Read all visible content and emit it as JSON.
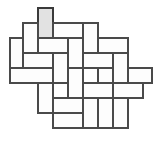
{
  "figure": {
    "width": 162,
    "height": 141,
    "background_color": "#ffffff",
    "unit": 15,
    "tile_long_side": 30,
    "tile_short_side": 15,
    "origin_x": 10,
    "origin_y": 8,
    "colors": {
      "tile_fill": "#fdfdfd",
      "tile_stroke": "#4a4a4a",
      "shaded_fill": "#e2e2e2",
      "shaded_stroke": "#3a3a3a"
    },
    "stroke_width": 1.4,
    "shaded_tile_index": 0,
    "tile_count": 20,
    "tiles": [
      {
        "name": "shaded-vertical-top",
        "x": 38,
        "y": 8,
        "w": 15,
        "h": 30,
        "orient": "vertical",
        "shaded": true
      },
      {
        "name": "tile-01",
        "x": 23,
        "y": 23,
        "w": 15,
        "h": 30,
        "orient": "vertical",
        "shaded": false
      },
      {
        "name": "tile-02",
        "x": 53,
        "y": 23,
        "w": 30,
        "h": 15,
        "orient": "horizontal",
        "shaded": false
      },
      {
        "name": "tile-03",
        "x": 83,
        "y": 23,
        "w": 15,
        "h": 30,
        "orient": "vertical",
        "shaded": false
      },
      {
        "name": "tile-04",
        "x": 98,
        "y": 38,
        "w": 30,
        "h": 15,
        "orient": "horizontal",
        "shaded": false
      },
      {
        "name": "tile-05",
        "x": 10,
        "y": 38,
        "w": 13,
        "h": 30,
        "orient": "vertical",
        "shaded": false
      },
      {
        "name": "tile-06",
        "x": 38,
        "y": 38,
        "w": 30,
        "h": 15,
        "orient": "horizontal",
        "shaded": false
      },
      {
        "name": "tile-07",
        "x": 68,
        "y": 38,
        "w": 15,
        "h": 30,
        "orient": "vertical",
        "shaded": false
      },
      {
        "name": "tile-08",
        "x": 113,
        "y": 53,
        "w": 15,
        "h": 30,
        "orient": "vertical",
        "shaded": false
      },
      {
        "name": "tile-09",
        "x": 83,
        "y": 53,
        "w": 30,
        "h": 15,
        "orient": "horizontal",
        "shaded": false
      },
      {
        "name": "tile-10",
        "x": 53,
        "y": 53,
        "w": 15,
        "h": 30,
        "orient": "vertical",
        "shaded": false
      },
      {
        "name": "tile-11",
        "x": 10,
        "y": 68,
        "w": 43,
        "h": 15,
        "orient": "horizontal",
        "shaded": false
      },
      {
        "name": "tile-12",
        "x": 128,
        "y": 68,
        "w": 24,
        "h": 15,
        "orient": "horizontal",
        "shaded": false
      },
      {
        "name": "tile-13",
        "x": 68,
        "y": 68,
        "w": 15,
        "h": 30,
        "orient": "vertical",
        "shaded": false
      },
      {
        "name": "tile-14",
        "x": 98,
        "y": 68,
        "w": 15,
        "h": 30,
        "orient": "vertical",
        "shaded": false
      },
      {
        "name": "tile-15",
        "x": 83,
        "y": 83,
        "w": 30,
        "h": 15,
        "orient": "horizontal",
        "shaded": false
      },
      {
        "name": "tile-16",
        "x": 113,
        "y": 83,
        "w": 30,
        "h": 15,
        "orient": "horizontal",
        "shaded": false
      },
      {
        "name": "tile-17",
        "x": 38,
        "y": 83,
        "w": 15,
        "h": 30,
        "orient": "vertical",
        "shaded": false
      },
      {
        "name": "tile-18",
        "x": 53,
        "y": 98,
        "w": 30,
        "h": 15,
        "orient": "horizontal",
        "shaded": false
      },
      {
        "name": "tile-19",
        "x": 83,
        "y": 98,
        "w": 15,
        "h": 30,
        "orient": "vertical",
        "shaded": false
      },
      {
        "name": "tile-20",
        "x": 113,
        "y": 98,
        "w": 15,
        "h": 30,
        "orient": "vertical",
        "shaded": false
      },
      {
        "name": "tile-21",
        "x": 98,
        "y": 98,
        "w": 15,
        "h": 30,
        "orient": "vertical",
        "shaded": false
      },
      {
        "name": "tile-22",
        "x": 53,
        "y": 113,
        "w": 30,
        "h": 15,
        "orient": "horizontal",
        "shaded": false
      },
      {
        "name": "tile-23",
        "x": 23,
        "y": 53,
        "w": 30,
        "h": 15,
        "orient": "horizontal",
        "shaded": false
      }
    ]
  }
}
